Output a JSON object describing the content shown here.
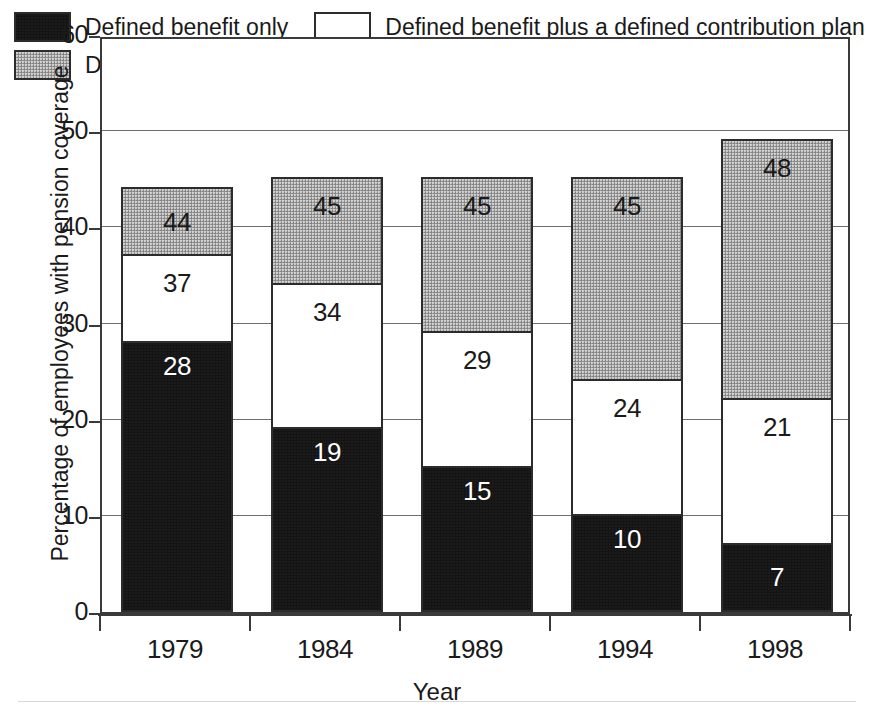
{
  "chart_data": {
    "type": "bar",
    "subtype": "stacked-cumulative-labels",
    "title": "",
    "xlabel": "Year",
    "ylabel": "Percentage of employees with pension coverage",
    "categories": [
      "1979",
      "1984",
      "1989",
      "1994",
      "1998"
    ],
    "ylim": [
      0,
      60
    ],
    "ytick_values": [
      0,
      10,
      20,
      30,
      40,
      50,
      60
    ],
    "ytick_labels": [
      "0",
      "10",
      "20",
      "30",
      "40",
      "50",
      "60"
    ],
    "grid": true,
    "grid_axis": "y",
    "legend_position": "inside-top-left",
    "label_style": "cumulative running total printed inside each segment",
    "series": [
      {
        "name": "Defined benefit only",
        "color": "#141414",
        "values": [
          28,
          19,
          15,
          10,
          7
        ],
        "cumulative": [
          28,
          19,
          15,
          10,
          7
        ],
        "labels": [
          "28",
          "19",
          "15",
          "10",
          "7"
        ],
        "label_color": "#ffffff"
      },
      {
        "name": "Defined benefit plus a defined contribution plan",
        "color": "#ffffff",
        "values": [
          9,
          15,
          14,
          14,
          15
        ],
        "cumulative": [
          37,
          34,
          29,
          24,
          22
        ],
        "labels": [
          "37",
          "34",
          "29",
          "24",
          "21"
        ],
        "label_color": "#1a1a1a"
      },
      {
        "name": "Defined contribution only",
        "color": "#9d9d9d",
        "values": [
          7,
          11,
          16,
          21,
          27
        ],
        "cumulative": [
          44,
          45,
          45,
          45,
          49
        ],
        "labels": [
          "44",
          "45",
          "45",
          "45",
          "48"
        ],
        "label_color": "#1a1a1a"
      }
    ],
    "bar_totals": [
      44,
      45,
      45,
      45,
      49
    ]
  },
  "legend": {
    "entries": [
      {
        "label": "Defined benefit only",
        "swatch": "black-filled-swatch"
      },
      {
        "label": "Defined benefit plus a defined contribution plan",
        "swatch": "white-open-swatch"
      },
      {
        "label": "Defined contribution only",
        "swatch": "gray-filled-swatch"
      }
    ]
  },
  "axes": {
    "y_title": "Percentage of employees with pension coverage",
    "x_title": "Year",
    "y_ticks": [
      "60",
      "50",
      "40",
      "30",
      "20",
      "10",
      "0"
    ],
    "x_ticks": [
      "1979",
      "1984",
      "1989",
      "1994",
      "1998"
    ]
  },
  "colors": {
    "defined_benefit": "#141414",
    "defined_benefit_plus": "#ffffff",
    "defined_contribution": "#9d9d9d",
    "axis": "#3a3a3a",
    "grid": "#6e6e6e",
    "text": "#1a1a1a"
  }
}
